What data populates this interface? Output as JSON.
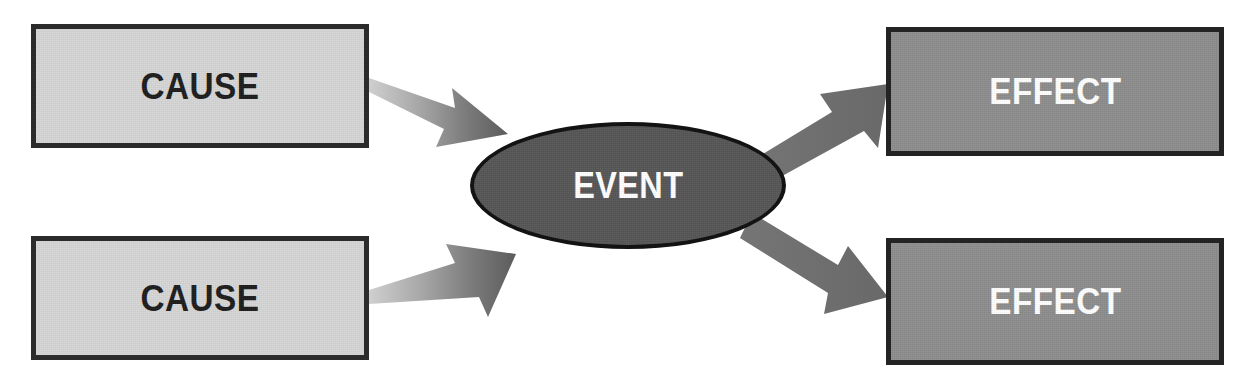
{
  "diagram": {
    "canvas": {
      "width": 1251,
      "height": 390,
      "background": "#ffffff"
    },
    "colors": {
      "cause_fill": "#d6d6d6",
      "cause_border": "#2b2b2b",
      "cause_text": "#1c1c1c",
      "effect_fill": "#8d8d8d",
      "effect_border": "#232323",
      "effect_text": "#ffffff",
      "event_fill": "#565656",
      "event_border": "#131313",
      "event_text": "#ffffff",
      "arrow_in_light": "#c9c9c9",
      "arrow_in_dark": "#5f5f5f",
      "arrow_out": "#6e6e6e"
    },
    "nodes": [
      {
        "id": "cause-top",
        "label": "CAUSE",
        "shape": "rectangle",
        "role": "cause",
        "x": 31,
        "y": 24,
        "width": 338,
        "height": 124
      },
      {
        "id": "cause-bottom",
        "label": "CAUSE",
        "shape": "rectangle",
        "role": "cause",
        "x": 31,
        "y": 236,
        "width": 338,
        "height": 124
      },
      {
        "id": "event",
        "label": "EVENT",
        "shape": "ellipse",
        "role": "event",
        "x": 470,
        "y": 122,
        "width": 316,
        "height": 127
      },
      {
        "id": "effect-top",
        "label": "EFFECT",
        "shape": "rectangle",
        "role": "effect",
        "x": 886,
        "y": 27,
        "width": 338,
        "height": 129
      },
      {
        "id": "effect-bottom",
        "label": "EFFECT",
        "shape": "rectangle",
        "role": "effect",
        "x": 886,
        "y": 238,
        "width": 338,
        "height": 127
      }
    ],
    "arrows": [
      {
        "id": "arrow-cause-top-to-event",
        "from": "cause-top",
        "to": "event",
        "direction": "down-right",
        "style": "gradient-light-to-dark"
      },
      {
        "id": "arrow-cause-bottom-to-event",
        "from": "cause-bottom",
        "to": "event",
        "direction": "up-right",
        "style": "gradient-light-to-dark"
      },
      {
        "id": "arrow-event-to-effect-top",
        "from": "event",
        "to": "effect-top",
        "direction": "up-right",
        "style": "solid"
      },
      {
        "id": "arrow-event-to-effect-bottom",
        "from": "event",
        "to": "effect-bottom",
        "direction": "down-right",
        "style": "solid"
      }
    ]
  }
}
